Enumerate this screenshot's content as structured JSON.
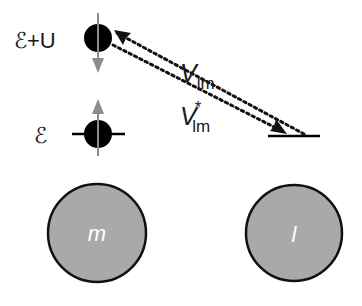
{
  "diagram": {
    "levels": {
      "upper": {
        "label": "ℰ+U",
        "spin": "down"
      },
      "lower": {
        "label": "ℰ",
        "spin": "up"
      }
    },
    "hopping": {
      "forward": {
        "symbol": "V",
        "subscript": "lm"
      },
      "backward": {
        "symbol": "V",
        "superscript": "*",
        "subscript": "lm"
      }
    },
    "sites": [
      {
        "label": "m"
      },
      {
        "label": "l"
      }
    ],
    "colors": {
      "electron": "#000000",
      "spin_arrow": "#8c8c8c",
      "site_fill": "#a9a9a9",
      "site_stroke": "#111111",
      "site_label": "#ffffff",
      "dotted_line": "#111111"
    }
  }
}
